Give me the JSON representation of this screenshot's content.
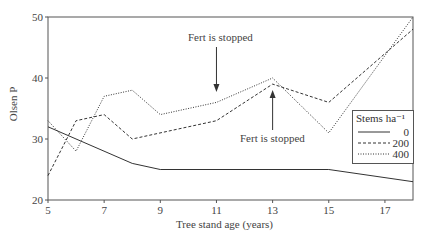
{
  "chart_data": {
    "type": "line",
    "title": "",
    "xlabel": "Tree stand age (years)",
    "ylabel": "Olsen P",
    "xlim": [
      5,
      18
    ],
    "ylim": [
      20,
      50
    ],
    "xticks": [
      5,
      7,
      9,
      11,
      13,
      15,
      17
    ],
    "yticks": [
      20,
      30,
      40,
      50
    ],
    "legend": {
      "title": "Stems ha⁻¹",
      "position": "lower right",
      "entries": [
        "0",
        "200",
        "400"
      ]
    },
    "series": [
      {
        "name": "0",
        "style": "solid",
        "x": [
          5,
          8,
          9,
          15,
          18
        ],
        "values": [
          32,
          26,
          25,
          25,
          23
        ]
      },
      {
        "name": "200",
        "style": "dashed",
        "x": [
          5,
          6,
          7,
          8,
          11,
          13,
          15,
          18
        ],
        "values": [
          24,
          33,
          34,
          30,
          33,
          39,
          36,
          48
        ]
      },
      {
        "name": "400",
        "style": "dotted",
        "x": [
          5,
          6,
          7,
          8,
          9,
          11,
          13,
          15,
          18
        ],
        "values": [
          33,
          28,
          37,
          38,
          34,
          36,
          40,
          31,
          50
        ]
      }
    ],
    "annotations": [
      {
        "text": "Fert is stopped",
        "x": 11,
        "arrow": "down"
      },
      {
        "text": "Fert is stopped",
        "x": 13,
        "arrow": "up"
      }
    ]
  }
}
